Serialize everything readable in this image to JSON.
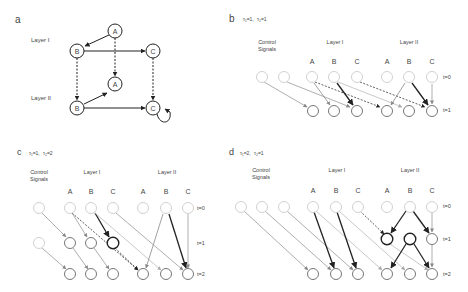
{
  "panels": {
    "a": {
      "letter": "a",
      "layer1": "Layer I",
      "layer2": "Layer II",
      "nodes": {
        "A": "A",
        "B": "B",
        "C": "C"
      }
    },
    "b": {
      "letter": "b",
      "tau1": "τ₁=1,",
      "tau2": "τ₂=1",
      "control": [
        "Control",
        "Signals"
      ],
      "layer1": "Layer I",
      "layer2": "Layer II",
      "t_labels": [
        "t=0",
        "t=1"
      ]
    },
    "c": {
      "letter": "c",
      "tau1": "τ₁=1,",
      "tau2": "τ₂=2",
      "control": [
        "Control",
        "Signals"
      ],
      "layer1": "Layer I",
      "layer2": "Layer II",
      "t_labels": [
        "t=0",
        "t=1",
        "t=2"
      ]
    },
    "d": {
      "letter": "d",
      "tau1": "τ₁=2,",
      "tau2": "τ₂=1",
      "control": [
        "Control",
        "Signals"
      ],
      "layer1": "Layer I",
      "layer2": "Layer II",
      "t_labels": [
        "t=0",
        "t=1",
        "t=2"
      ]
    }
  },
  "node_letters": [
    "A",
    "B",
    "C"
  ],
  "colors": {
    "light": "#c8c8c8",
    "mid": "#8a8a8a",
    "dark": "#2a2a2a",
    "text": "#444444"
  }
}
